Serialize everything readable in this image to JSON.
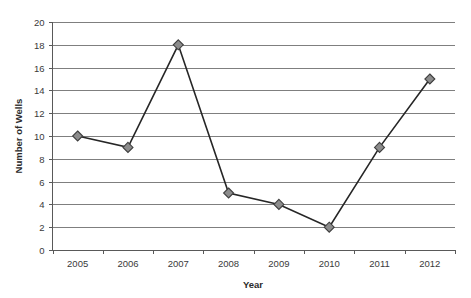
{
  "chart_data": {
    "type": "line",
    "title": "",
    "xlabel": "Year",
    "ylabel": "Number of Wells",
    "categories": [
      "2005",
      "2006",
      "2007",
      "2008",
      "2009",
      "2010",
      "2011",
      "2012"
    ],
    "values": [
      10,
      9,
      18,
      5,
      4,
      2,
      9,
      15
    ],
    "series": [
      {
        "name": "Number of Wells",
        "values": [
          10,
          9,
          18,
          5,
          4,
          2,
          9,
          15
        ]
      }
    ],
    "ylim": [
      0,
      20
    ],
    "ytick_step": 2,
    "yticks": [
      "0",
      "2",
      "4",
      "6",
      "8",
      "10",
      "12",
      "14",
      "16",
      "18",
      "20"
    ],
    "xticks": [
      "2005",
      "2006",
      "2007",
      "2008",
      "2009",
      "2010",
      "2011",
      "2012"
    ],
    "grid": "horizontal",
    "legend": "none",
    "marker": "diamond",
    "colors": {
      "line": "#262626",
      "marker_fill": "#8c8c8c",
      "marker_edge": "#3f3f3f",
      "gridline": "#7f7f7f",
      "axis": "#595959",
      "text": "#3a3a3a",
      "background": "#ffffff"
    }
  },
  "points": [
    {
      "x": "2005",
      "y": 10
    },
    {
      "x": "2006",
      "y": 9
    },
    {
      "x": "2007",
      "y": 18
    },
    {
      "x": "2008",
      "y": 5
    },
    {
      "x": "2009",
      "y": 4
    },
    {
      "x": "2010",
      "y": 2
    },
    {
      "x": "2011",
      "y": 9
    },
    {
      "x": "2012",
      "y": 15
    }
  ]
}
